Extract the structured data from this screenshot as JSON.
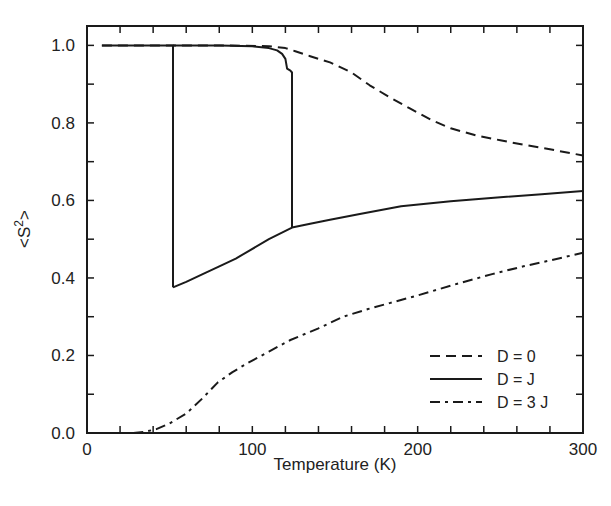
{
  "chart_data": {
    "type": "line",
    "title": "",
    "xlabel": "Temperature (K)",
    "ylabel": "<S²>",
    "xlim": [
      0,
      300
    ],
    "ylim": [
      0.0,
      1.05
    ],
    "x_ticks": [
      0,
      100,
      200,
      300
    ],
    "x_tick_labels": [
      "0",
      "100",
      "200",
      "300"
    ],
    "x_minor_step": 20,
    "y_ticks": [
      0.0,
      0.2,
      0.4,
      0.6,
      0.8,
      1.0
    ],
    "y_tick_labels": [
      "0.0",
      "0.2",
      "0.4",
      "0.6",
      "0.8",
      "1.0"
    ],
    "y_minor_step": 0.1,
    "grid": false,
    "legend_position": "lower right",
    "series": [
      {
        "name": "D = 0",
        "style": "dashed",
        "x": [
          9,
          40,
          80,
          110,
          120,
          126,
          135,
          147,
          160,
          171,
          183,
          195,
          208,
          220,
          235,
          250,
          265,
          280,
          300
        ],
        "y": [
          1.0,
          1.0,
          1.0,
          0.998,
          0.993,
          0.985,
          0.972,
          0.956,
          0.93,
          0.897,
          0.866,
          0.838,
          0.808,
          0.786,
          0.768,
          0.755,
          0.743,
          0.732,
          0.716
        ]
      },
      {
        "name": "D = J",
        "style": "solid",
        "branches": [
          {
            "label": "cooling / high-spin branch",
            "x": [
              9,
              52,
              52
            ],
            "y": [
              1.0,
              1.0,
              0.376
            ]
          },
          {
            "label": "lower branch",
            "x": [
              52,
              60,
              70,
              80,
              90,
              98,
              110,
              124,
              135,
              147,
              165,
              190,
              220,
              250,
              275,
              300
            ],
            "y": [
              0.376,
              0.39,
              0.41,
              0.43,
              0.45,
              0.47,
              0.5,
              0.53,
              0.54,
              0.55,
              0.565,
              0.585,
              0.598,
              0.608,
              0.616,
              0.624
            ]
          },
          {
            "label": "heating / upper branch",
            "x": [
              52,
              80,
              100,
              110,
              115,
              118,
              120,
              121,
              123,
              124,
              124
            ],
            "y": [
              1.0,
              1.0,
              0.998,
              0.993,
              0.987,
              0.978,
              0.965,
              0.94,
              0.935,
              0.93,
              0.53
            ]
          }
        ]
      },
      {
        "name": "D = 3 J",
        "style": "dashdot",
        "x": [
          28,
          35,
          42,
          50,
          60,
          70,
          79,
          88,
          97,
          110,
          123,
          140,
          155,
          170,
          183,
          200,
          224,
          245,
          264,
          280,
          300
        ],
        "y": [
          0.0,
          0.003,
          0.01,
          0.025,
          0.05,
          0.09,
          0.13,
          0.157,
          0.18,
          0.21,
          0.24,
          0.27,
          0.3,
          0.32,
          0.335,
          0.355,
          0.385,
          0.41,
          0.43,
          0.445,
          0.465
        ]
      }
    ]
  },
  "legend": {
    "items": [
      {
        "label": "D = 0",
        "style": "dashed"
      },
      {
        "label": "D = J",
        "style": "solid"
      },
      {
        "label": "D = 3 J",
        "style": "dashdot"
      }
    ]
  },
  "colors": {
    "line": "#1a1a1a",
    "frame": "#1a1a1a",
    "background": "#ffffff"
  }
}
